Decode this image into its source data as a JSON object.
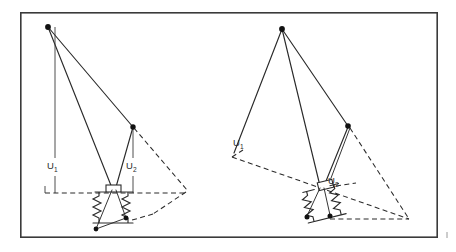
{
  "figure": {
    "background_color": "#ffffff",
    "frame": {
      "stroke_color": "#3a3a3a",
      "x": 20,
      "y": 12,
      "width": 418,
      "height": 226
    },
    "line_colors": {
      "solid": "#2a2a2a",
      "dashed": "#2a2a2a",
      "dimension": "#3a3a3a",
      "node": "#111111"
    }
  },
  "panels": [
    {
      "id": "left-panel",
      "name": "undeflected-configuration",
      "apex": {
        "x": 48,
        "y": 27
      },
      "node": {
        "x": 133,
        "y": 127
      },
      "block": {
        "x": 106,
        "y": 185,
        "width": 15,
        "height": 7
      },
      "base": {
        "left_x": 96,
        "right_x": 131,
        "y": 223
      },
      "dashed_vertex": {
        "x": 186,
        "y": 189
      },
      "dashed_lower_vertex": {
        "x": 167,
        "y": 214
      },
      "dimensions": [
        {
          "id": "left-u1",
          "label": "U",
          "subscript": "1",
          "label_x": 52,
          "label_y": 166,
          "line_x": 55,
          "top_y": 27,
          "bottom_y": 193,
          "tick_y": 193,
          "tick_from_x": 44,
          "tick_to_x": 110
        },
        {
          "id": "left-u2",
          "label": "U",
          "subscript": "2",
          "label_x": 129,
          "label_y": 166,
          "line_x": 133,
          "top_y": 127,
          "bottom_y": 193,
          "tick_y": 193,
          "tick_from_x": 124,
          "tick_to_x": 142
        }
      ]
    },
    {
      "id": "right-panel",
      "name": "deflected-configuration",
      "apex": {
        "x": 282,
        "y": 29
      },
      "node": {
        "x": 348,
        "y": 126
      },
      "block": {
        "x": 318,
        "y": 181,
        "width": 15,
        "height": 8
      },
      "base": {
        "left_x": 306,
        "right_x": 330,
        "y": 219
      },
      "dashed_vertex": {
        "x": 409,
        "y": 219
      },
      "dashed_upper_left": {
        "x": 232,
        "y": 157
      },
      "dimensions": [
        {
          "id": "right-u1",
          "label": "U",
          "subscript": "1",
          "label_x": 236,
          "label_y": 143
        },
        {
          "id": "right-u2",
          "label": "U",
          "subscript": "2",
          "label_x": 330,
          "label_y": 181
        }
      ]
    }
  ],
  "legend": {
    "solid_meaning": "structural member",
    "dashed_meaning": "reference / displaced position",
    "spring_meaning": "compression spring"
  }
}
